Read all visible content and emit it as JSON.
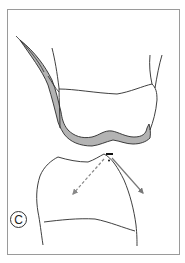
{
  "figure": {
    "panel_label": "C",
    "colors": {
      "frame": "#9a9a9a",
      "outline": "#2a2a2a",
      "restoration_fill": "#b3b3b3",
      "arrow_solid": "#777777",
      "arrow_dashed": "#888888",
      "background": "#ffffff"
    },
    "elements": [
      "frame",
      "upper-tooth-crown",
      "restoration-layer",
      "lower-tooth",
      "contact-point-marker",
      "force-arrow-dashed",
      "force-arrow-solid",
      "panel-label"
    ]
  }
}
